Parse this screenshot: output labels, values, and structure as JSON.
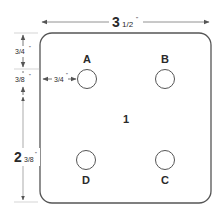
{
  "diagram": {
    "plate_label": "1",
    "colors": {
      "line": "#555555",
      "text": "#2a2a2a",
      "background": "#ffffff"
    },
    "dimensions": {
      "width": {
        "whole": "3",
        "fraction": "1/2",
        "unit": "\""
      },
      "top_offset": {
        "value": "3/4",
        "unit": "\""
      },
      "hole_diameter": {
        "value": "3/8",
        "unit": "\""
      },
      "side_offset": {
        "value": "3/4",
        "unit": "\""
      },
      "hole_spacing": {
        "whole": "2",
        "fraction": "3/8",
        "unit": "\""
      }
    },
    "holes": [
      {
        "id": "A",
        "label": "A"
      },
      {
        "id": "B",
        "label": "B"
      },
      {
        "id": "C",
        "label": "C"
      },
      {
        "id": "D",
        "label": "D"
      }
    ]
  }
}
